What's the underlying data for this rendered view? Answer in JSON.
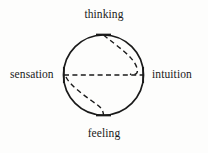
{
  "diagram": {
    "name": "jung-psychological-functions-compass",
    "background_color": "#fdfdfc",
    "stroke_color": "#1a1a1a",
    "labels": {
      "top": "thinking",
      "bottom": "feeling",
      "left": "sensation",
      "right": "intuition"
    },
    "circle": {
      "center_x": 103.5,
      "center_y": 75,
      "radius": 40,
      "stroke_width": 1.6,
      "style": "solid"
    },
    "axes": {
      "style": "dashed",
      "horizontal": {
        "from_label": "sensation",
        "to_label": "intuition",
        "x1": 64,
        "x2": 143,
        "y": 75
      },
      "tick_marks": [
        {
          "name": "tick-top",
          "x": 103.5,
          "y": 35,
          "orientation": "horizontal"
        },
        {
          "name": "tick-bottom",
          "x": 103.5,
          "y": 115,
          "orientation": "horizontal"
        },
        {
          "name": "tick-left",
          "x": 64,
          "y": 75,
          "orientation": "vertical"
        },
        {
          "name": "tick-right",
          "x": 143,
          "y": 75,
          "orientation": "vertical"
        }
      ]
    },
    "s_curve": {
      "description": "dashed S-shaped curve linking thinking to intuition and sensation to feeling",
      "style": "dashed",
      "upper_segment": "from top tick bulging right toward the right tick",
      "lower_segment": "from left tick bulging down toward the bottom tick"
    }
  }
}
